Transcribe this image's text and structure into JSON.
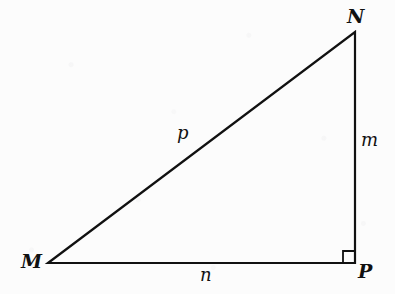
{
  "figure": {
    "type": "right-triangle-diagram",
    "background_color": "#fcfcfc",
    "stroke_color": "#111111",
    "stroke_width": 2.2
  },
  "geometry": {
    "vertices": [
      {
        "id": "M",
        "x": 48,
        "y": 263
      },
      {
        "id": "N",
        "x": 355,
        "y": 32
      },
      {
        "id": "P",
        "x": 355,
        "y": 263
      }
    ],
    "edges": [
      {
        "id": "MN",
        "from": "M",
        "to": "N",
        "label": "p",
        "role": "hypotenuse"
      },
      {
        "id": "NP",
        "from": "N",
        "to": "P",
        "label": "m",
        "role": "leg-vertical"
      },
      {
        "id": "MP",
        "from": "M",
        "to": "P",
        "label": "n",
        "role": "leg-horizontal"
      }
    ],
    "right_angle": {
      "at": "P",
      "size": 12
    },
    "polygon_points": "48,263 355,32 355,263"
  },
  "labels": {
    "vertices": [
      {
        "name": "vertex-label-M",
        "text": "M",
        "x": 21,
        "y": 252
      },
      {
        "name": "vertex-label-N",
        "text": "N",
        "x": 347,
        "y": 7
      },
      {
        "name": "vertex-label-P",
        "text": "P",
        "x": 358,
        "y": 262
      }
    ],
    "sides": [
      {
        "name": "side-label-p",
        "text": "p",
        "x": 177,
        "y": 124
      },
      {
        "name": "side-label-m",
        "text": "m",
        "x": 361,
        "y": 131
      },
      {
        "name": "side-label-n",
        "text": "n",
        "x": 200,
        "y": 266
      }
    ]
  }
}
